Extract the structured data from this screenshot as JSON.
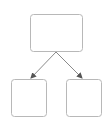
{
  "diagram": {
    "type": "tree",
    "colors": {
      "background": "#ffffff",
      "node_stroke": "#b8b8b8",
      "edge_stroke": "#8a8a8a",
      "arrow_fill": "#555555"
    },
    "nodes": [
      {
        "id": "root",
        "label": "",
        "x": 30.5,
        "y": 14.5,
        "w": 52,
        "h": 37
      },
      {
        "id": "left-child",
        "label": "",
        "x": 11.5,
        "y": 79.5,
        "w": 35,
        "h": 37
      },
      {
        "id": "right-child",
        "label": "",
        "x": 66.5,
        "y": 79.5,
        "w": 35,
        "h": 37
      }
    ],
    "edges": [
      {
        "from": "root",
        "to": "left-child",
        "x1": 56,
        "y1": 52,
        "x2": 31,
        "y2": 78
      },
      {
        "from": "root",
        "to": "right-child",
        "x1": 56,
        "y1": 52,
        "x2": 82,
        "y2": 78
      }
    ]
  }
}
